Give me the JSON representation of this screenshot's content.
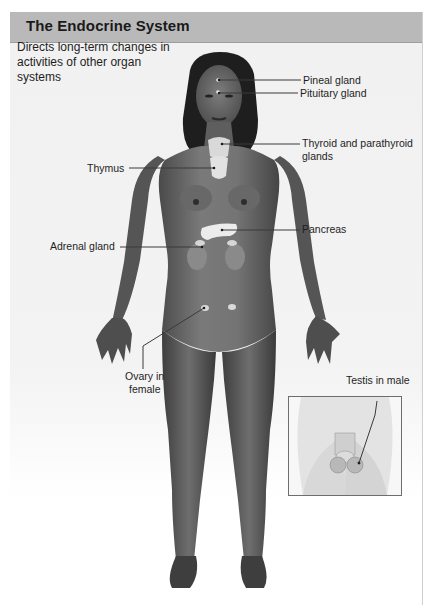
{
  "header": {
    "title": "The Endocrine System"
  },
  "description": "Directs long-term changes in activities of other organ systems",
  "labels": {
    "pineal": "Pineal gland",
    "pituitary": "Pituitary gland",
    "thyroid_line1": "Thyroid and parathyroid",
    "thyroid_line2": "glands",
    "thymus": "Thymus",
    "pancreas": "Pancreas",
    "adrenal": "Adrenal gland",
    "ovary_line1": "Ovary in",
    "ovary_line2": "female",
    "testis": "Testis in male"
  },
  "colors": {
    "header_bg": "#b9b9b9",
    "panel_bg": "#f1f1f1",
    "skin": "#6a6a6a",
    "gland": "#e6e6e6",
    "leader_line": "#3a3a3a"
  },
  "icons": {
    "figure": "female-body-illustration",
    "inset": "male-pelvis-inset-illustration"
  }
}
